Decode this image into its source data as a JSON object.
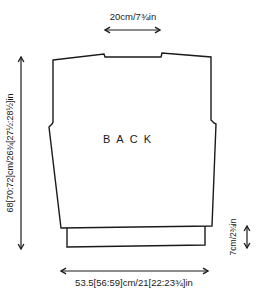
{
  "diagram": {
    "type": "knitting-schematic",
    "panel_label": "BACK",
    "measurements": {
      "neck_width": "20cm/7¾in",
      "length": "68[70:72]cm/26¾[27½:28½]in",
      "rib_depth": "7cm/2¾in",
      "width": "53.5[56:59]cm/21[22:23¾]in"
    },
    "colors": {
      "line": "#1a1a1a",
      "background": "#ffffff"
    }
  }
}
